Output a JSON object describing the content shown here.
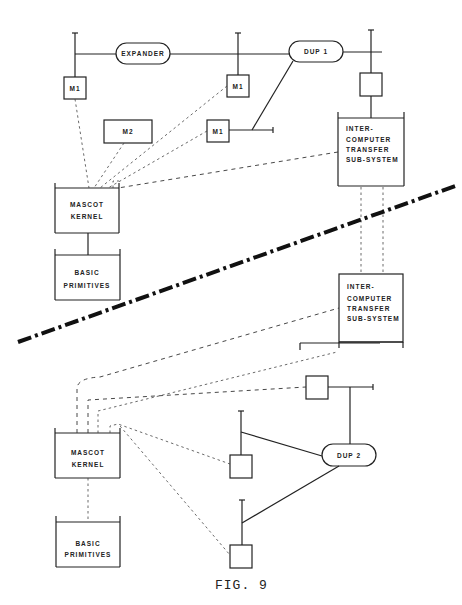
{
  "figure": {
    "caption": "FIG. 9"
  },
  "top_system": {
    "expander": "EXPANDER",
    "dup": "DUP 1",
    "m1_a": "M1",
    "m1_b": "M1",
    "m1_c": "M1",
    "m2": "M2",
    "ict": [
      "INTER-",
      "COMPUTER",
      "TRANSFER",
      "SUB-SYSTEM"
    ],
    "kernel": [
      "MASCOT",
      "KERNEL"
    ],
    "primitives": [
      "BASIC",
      "PRIMITIVES"
    ]
  },
  "bottom_system": {
    "dup": "DUP 2",
    "ict": [
      "INTER-",
      "COMPUTER",
      "TRANSFER",
      "SUB-SYSTEM"
    ],
    "kernel": [
      "MASCOT",
      "KERNEL"
    ],
    "primitives": [
      "BASIC",
      "PRIMITIVES"
    ]
  }
}
